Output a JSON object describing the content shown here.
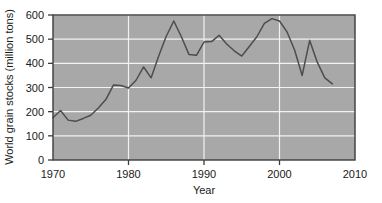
{
  "chart_data": {
    "type": "line",
    "title": "",
    "xlabel": "Year",
    "ylabel": "World grain stocks (million tons)",
    "xlim": [
      1970,
      2010
    ],
    "ylim": [
      0,
      600
    ],
    "xticks": [
      1970,
      1980,
      1990,
      2000,
      2010
    ],
    "yticks": [
      0,
      100,
      200,
      300,
      400,
      500,
      600
    ],
    "grid": "white gridlines on gray panel, both horizontal and vertical",
    "legend": "none",
    "line_color": "#4d4d4d",
    "panel_color": "#a8a8a8",
    "gridline_color": "#f2f2f2",
    "frame_color": "#3d3d3d",
    "x": [
      1970,
      1971,
      1972,
      1973,
      1974,
      1975,
      1976,
      1977,
      1978,
      1979,
      1980,
      1981,
      1982,
      1983,
      1984,
      1985,
      1986,
      1987,
      1988,
      1989,
      1990,
      1991,
      1992,
      1993,
      1994,
      1995,
      1996,
      1997,
      1998,
      1999,
      2000,
      2001,
      2002,
      2003,
      2004,
      2005,
      2006,
      2007
    ],
    "values": [
      175,
      205,
      165,
      160,
      172,
      185,
      215,
      250,
      310,
      308,
      298,
      330,
      385,
      340,
      430,
      512,
      575,
      510,
      437,
      433,
      488,
      490,
      516,
      480,
      452,
      430,
      470,
      510,
      565,
      585,
      575,
      530,
      455,
      350,
      495,
      405,
      340,
      315
    ],
    "series": [
      {
        "name": "World grain stocks",
        "values": [
          175,
          205,
          165,
          160,
          172,
          185,
          215,
          250,
          310,
          308,
          298,
          330,
          385,
          340,
          430,
          512,
          575,
          510,
          437,
          433,
          488,
          490,
          516,
          480,
          452,
          430,
          470,
          510,
          565,
          585,
          575,
          530,
          455,
          350,
          495,
          405,
          340,
          315
        ]
      }
    ],
    "annotations": []
  },
  "axes": {
    "y_title": "World grain stocks (million tons)",
    "x_title": "Year",
    "y_tick_labels": [
      "0",
      "100",
      "200",
      "300",
      "400",
      "500",
      "600"
    ],
    "x_tick_labels": [
      "1970",
      "1980",
      "1990",
      "2000",
      "2010"
    ]
  }
}
